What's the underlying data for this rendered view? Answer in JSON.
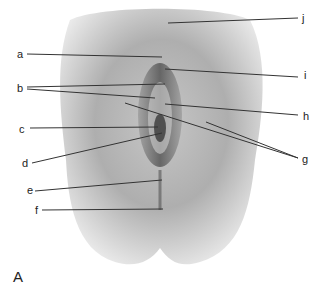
{
  "figure": {
    "panel_letter": "A",
    "labels": [
      {
        "id": "a",
        "text": "a",
        "x": 17,
        "y": 49
      },
      {
        "id": "b",
        "text": "b",
        "x": 17,
        "y": 83
      },
      {
        "id": "c",
        "text": "c",
        "x": 19,
        "y": 124
      },
      {
        "id": "d",
        "text": "d",
        "x": 22,
        "y": 158
      },
      {
        "id": "e",
        "text": "e",
        "x": 27,
        "y": 185
      },
      {
        "id": "f",
        "text": "f",
        "x": 35,
        "y": 205
      },
      {
        "id": "g",
        "text": "g",
        "x": 302,
        "y": 154
      },
      {
        "id": "h",
        "text": "h",
        "x": 303,
        "y": 111
      },
      {
        "id": "i",
        "text": "i",
        "x": 304,
        "y": 70
      },
      {
        "id": "j",
        "text": "j",
        "x": 302,
        "y": 13
      }
    ],
    "colors": {
      "line": "#333333",
      "shade_dark": "#6e6e6e",
      "shade_light": "#d8d8d8"
    }
  }
}
